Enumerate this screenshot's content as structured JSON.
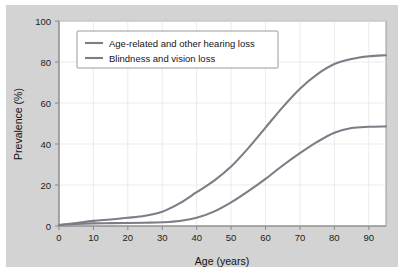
{
  "figure": {
    "background_color": "#d3d3d3",
    "plot_background_color": "#ffffff",
    "frame_color": "#9a9a9a"
  },
  "chart_data": {
    "type": "line",
    "title": "",
    "xlabel": "Age (years)",
    "ylabel": "Prevalence (%)",
    "xlim": [
      0,
      95
    ],
    "ylim": [
      0,
      100
    ],
    "xticks": [
      0,
      10,
      20,
      30,
      40,
      50,
      60,
      70,
      80,
      90
    ],
    "xtick_labels": [
      "0",
      "10",
      "20",
      "30",
      "40",
      "50",
      "60",
      "70",
      "80",
      "90"
    ],
    "yticks": [
      0,
      20,
      40,
      60,
      80,
      100
    ],
    "ytick_labels": [
      "0",
      "20",
      "40",
      "60",
      "80",
      "100"
    ],
    "grid": true,
    "legend_position": "upper left",
    "x": [
      0,
      5,
      10,
      15,
      20,
      25,
      30,
      35,
      40,
      45,
      50,
      55,
      60,
      65,
      70,
      75,
      80,
      85,
      90,
      95
    ],
    "series": [
      {
        "name": "Age-related and other hearing loss",
        "color": "#7d7d87",
        "values": [
          0.5,
          1.5,
          2.5,
          3.2,
          4.0,
          5.0,
          7.0,
          11.0,
          16.5,
          22.0,
          29.0,
          38.0,
          48.0,
          58.0,
          67.0,
          74.0,
          79.0,
          81.5,
          82.8,
          83.3
        ]
      },
      {
        "name": "Blindness and vision loss",
        "color": "#7d7d87",
        "values": [
          0.5,
          1.0,
          1.3,
          1.4,
          1.5,
          1.6,
          1.8,
          2.4,
          4.0,
          7.0,
          11.5,
          17.0,
          23.0,
          29.5,
          35.5,
          41.0,
          45.5,
          47.8,
          48.4,
          48.6
        ]
      }
    ]
  },
  "legend": {
    "entries": [
      {
        "label": "Age-related and other hearing loss",
        "color": "#7d7d87"
      },
      {
        "label": "Blindness and vision loss",
        "color": "#7d7d87"
      }
    ]
  }
}
